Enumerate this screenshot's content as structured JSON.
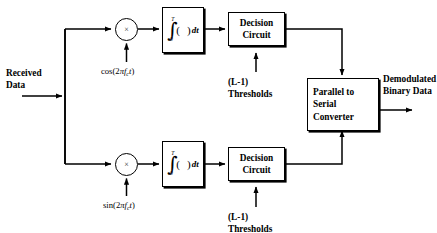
{
  "diagram": {
    "ink_color": "#000000",
    "background_color": "#ffffff"
  },
  "input": {
    "label_line1": "Received",
    "label_line2": "Data"
  },
  "output": {
    "label_line1": "Demodulated",
    "label_line2": "Binary Data"
  },
  "branches": {
    "top": {
      "multiplier_symbol": "×",
      "carrier_prefix": "cos(2",
      "carrier_pi": "π",
      "carrier_f": "f",
      "carrier_sub": "c",
      "carrier_t": "t",
      "carrier_suffix": ")",
      "integrator_upper_limit": "T",
      "integrator_lower_limit": "0",
      "integrator_integrand": "(  )",
      "integrator_differential": "dt",
      "decision_line1": "Decision",
      "decision_line2": "Circuit",
      "threshold_line1": "(L-1)",
      "threshold_line2": "Thresholds"
    },
    "bottom": {
      "multiplier_symbol": "×",
      "carrier_prefix": "sin(2",
      "carrier_pi": "π",
      "carrier_f": "f",
      "carrier_sub": "c",
      "carrier_t": "t",
      "carrier_suffix": ")",
      "integrator_upper_limit": "T",
      "integrator_lower_limit": "0",
      "integrator_integrand": "(  )",
      "integrator_differential": "dt",
      "decision_line1": "Decision",
      "decision_line2": "Circuit",
      "threshold_line1": "(L-1)",
      "threshold_line2": "Thresholds"
    }
  },
  "converter": {
    "line1": "Parallel to",
    "line2": "Serial",
    "line3": "Converter"
  }
}
